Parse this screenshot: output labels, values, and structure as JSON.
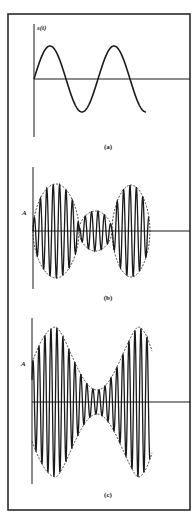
{
  "colors": {
    "background": "#ffffff",
    "frame": "#2a2a2a",
    "ink": "#1a1a1a"
  },
  "frame": {
    "x": 8,
    "y": 14,
    "width": 182,
    "height": 496
  },
  "panels": [
    {
      "id": "a",
      "caption": "(a)",
      "y_label": "s(t)",
      "axis": {
        "x": 34,
        "y_top": 24,
        "y_bottom": 137,
        "baseline_y": 79,
        "x_end": 190
      },
      "caption_pos": {
        "x": 108,
        "y": 149
      },
      "y_label_pos": {
        "x": 37,
        "y": 30
      },
      "signal": {
        "type": "sine",
        "x_start": 34,
        "x_end": 146,
        "amplitude": 33,
        "period": 64
      }
    },
    {
      "id": "b",
      "caption": "(b)",
      "y_label": "A",
      "axis": {
        "x": 33,
        "y_top": 167,
        "y_bottom": 289,
        "baseline_y": 231,
        "x_end": 190
      },
      "caption_pos": {
        "x": 108,
        "y": 300
      },
      "y_label_pos": {
        "x": 22,
        "y": 215
      },
      "signal": {
        "type": "am-lobes",
        "x_start": 33,
        "x_end": 149,
        "carrier_period": 6.4,
        "lobes": [
          {
            "x0": 33,
            "x1": 79,
            "amplitude": 47
          },
          {
            "x0": 79,
            "x1": 112,
            "amplitude": 20
          },
          {
            "x0": 112,
            "x1": 150,
            "amplitude": 46
          }
        ]
      }
    },
    {
      "id": "c",
      "caption": "(c)",
      "y_label": "A",
      "axis": {
        "x": 32,
        "y_top": 318,
        "y_bottom": 484,
        "baseline_y": 402,
        "x_end": 190
      },
      "caption_pos": {
        "x": 108,
        "y": 497
      },
      "y_label_pos": {
        "x": 21,
        "y": 366
      },
      "signal": {
        "type": "am-waist",
        "x_start": 32,
        "x_end": 150,
        "carrier_period": 6.0,
        "max_amplitude": 75,
        "min_amplitude": 12,
        "peak_left_x": 56,
        "peak_right_x": 138,
        "waist_x": 97
      }
    }
  ]
}
